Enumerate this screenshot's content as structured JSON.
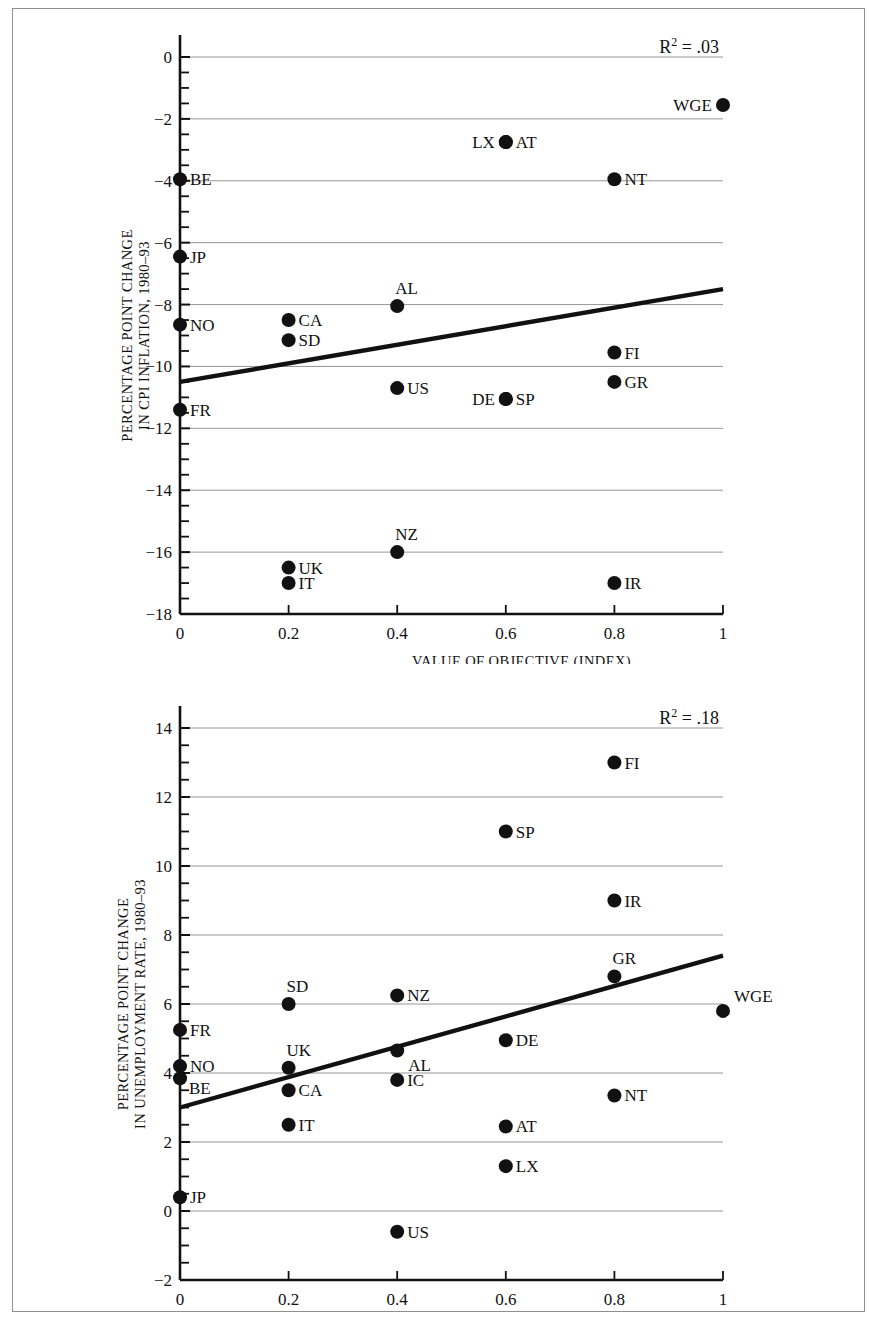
{
  "figure": {
    "background": "#ffffff",
    "frame_color": "#8f8f8f",
    "marker_color": "#111111",
    "gridline_color": "#8a8a8a",
    "axis_color": "#111111",
    "trend_color": "#111111"
  },
  "chart_data": [
    {
      "id": "cpi-inflation",
      "type": "scatter",
      "title": "",
      "xlabel": "VALUE OF OBJECTIVE (INDEX)",
      "ylabel": "PERCENTAGE POINT CHANGE IN CPI INFLATION, 1980–93",
      "ylabel_line1": "PERCENTAGE POINT CHANGE",
      "ylabel_line2": "IN CPI INFLATION, 1980–93",
      "annotation": "R² = .03",
      "annotation_base": "R",
      "annotation_sup": "2",
      "annotation_rest": " = .03",
      "xlim": [
        0,
        1
      ],
      "ylim": [
        -18,
        0
      ],
      "xticks": [
        0,
        0.2,
        0.4,
        0.6,
        0.8,
        1
      ],
      "xticklabels": [
        "0",
        "0.2",
        "0.4",
        "0.6",
        "0.8",
        "1"
      ],
      "yticks": [
        0,
        -2,
        -4,
        -6,
        -8,
        -10,
        -12,
        -14,
        -16,
        -18
      ],
      "yticklabels": [
        "0",
        "−2",
        "−4",
        "−6",
        "−8",
        "−10",
        "−12",
        "−14",
        "−16",
        "−18"
      ],
      "yminor_step": 0.5,
      "grid": true,
      "grid_axis": "y",
      "legend": "none",
      "trendline": {
        "x0": 0,
        "y0": -10.5,
        "x1": 1,
        "y1": -7.5
      },
      "points": [
        {
          "label": "BE",
          "x": 0.0,
          "y": -3.95,
          "lpos": "right"
        },
        {
          "label": "JP",
          "x": 0.0,
          "y": -6.45,
          "lpos": "right"
        },
        {
          "label": "NO",
          "x": 0.0,
          "y": -8.65,
          "lpos": "right"
        },
        {
          "label": "FR",
          "x": 0.0,
          "y": -11.4,
          "lpos": "right"
        },
        {
          "label": "CA",
          "x": 0.2,
          "y": -8.5,
          "lpos": "right"
        },
        {
          "label": "SD",
          "x": 0.2,
          "y": -9.15,
          "lpos": "right"
        },
        {
          "label": "UK",
          "x": 0.2,
          "y": -16.5,
          "lpos": "right"
        },
        {
          "label": "IT",
          "x": 0.2,
          "y": -17.0,
          "lpos": "right"
        },
        {
          "label": "AL",
          "x": 0.4,
          "y": -8.05,
          "lpos": "above"
        },
        {
          "label": "US",
          "x": 0.4,
          "y": -10.7,
          "lpos": "right"
        },
        {
          "label": "NZ",
          "x": 0.4,
          "y": -16.0,
          "lpos": "above"
        },
        {
          "label": "AT",
          "x": 0.6,
          "y": -2.75,
          "lpos": "right"
        },
        {
          "label": "LX",
          "x": 0.6,
          "y": -2.75,
          "lpos": "left"
        },
        {
          "label": "SP",
          "x": 0.6,
          "y": -11.05,
          "lpos": "right"
        },
        {
          "label": "DE",
          "x": 0.6,
          "y": -11.05,
          "lpos": "left"
        },
        {
          "label": "NT",
          "x": 0.8,
          "y": -3.95,
          "lpos": "right"
        },
        {
          "label": "FI",
          "x": 0.8,
          "y": -9.55,
          "lpos": "right"
        },
        {
          "label": "GR",
          "x": 0.8,
          "y": -10.5,
          "lpos": "right"
        },
        {
          "label": "IR",
          "x": 0.8,
          "y": -17.0,
          "lpos": "right"
        },
        {
          "label": "WGE",
          "x": 1.0,
          "y": -1.55,
          "lpos": "left"
        }
      ]
    },
    {
      "id": "unemployment-rate",
      "type": "scatter",
      "title": "",
      "xlabel": "VALUE OF OBJECTIVE (INDEX)",
      "ylabel": "PERCENTAGE POINT CHANGE IN UNEMPLOYMENT RATE, 1980–93",
      "ylabel_line1": "PERCENTAGE POINT CHANGE",
      "ylabel_line2": "IN UNEMPLOYMENT RATE, 1980–93",
      "annotation": "R² = .18",
      "annotation_base": "R",
      "annotation_sup": "2",
      "annotation_rest": " = .18",
      "xlim": [
        0,
        1
      ],
      "ylim": [
        -2,
        14
      ],
      "xticks": [
        0,
        0.2,
        0.4,
        0.6,
        0.8,
        1
      ],
      "xticklabels": [
        "0",
        "0.2",
        "0.4",
        "0.6",
        "0.8",
        "1"
      ],
      "yticks": [
        14,
        12,
        10,
        8,
        6,
        4,
        2,
        0,
        -2
      ],
      "yticklabels": [
        "14",
        "12",
        "10",
        "8",
        "6",
        "4",
        "2",
        "0",
        "−2"
      ],
      "yminor_step": 0.5,
      "grid": true,
      "grid_axis": "y",
      "legend": "none",
      "trendline": {
        "x0": 0,
        "y0": 3.0,
        "x1": 1,
        "y1": 7.4
      },
      "points": [
        {
          "label": "FR",
          "x": 0.0,
          "y": 5.25,
          "lpos": "right"
        },
        {
          "label": "NO",
          "x": 0.0,
          "y": 4.2,
          "lpos": "right"
        },
        {
          "label": "BE",
          "x": 0.0,
          "y": 3.85,
          "lpos": "rightlow"
        },
        {
          "label": "JP",
          "x": 0.0,
          "y": 0.4,
          "lpos": "right"
        },
        {
          "label": "SD",
          "x": 0.2,
          "y": 6.0,
          "lpos": "above"
        },
        {
          "label": "UK",
          "x": 0.2,
          "y": 4.15,
          "lpos": "above"
        },
        {
          "label": "CA",
          "x": 0.2,
          "y": 3.5,
          "lpos": "right"
        },
        {
          "label": "IT",
          "x": 0.2,
          "y": 2.5,
          "lpos": "right"
        },
        {
          "label": "NZ",
          "x": 0.4,
          "y": 6.25,
          "lpos": "right"
        },
        {
          "label": "AL",
          "x": 0.4,
          "y": 4.65,
          "lpos": "belowright"
        },
        {
          "label": "IC",
          "x": 0.4,
          "y": 3.8,
          "lpos": "right"
        },
        {
          "label": "US",
          "x": 0.4,
          "y": -0.6,
          "lpos": "right"
        },
        {
          "label": "SP",
          "x": 0.6,
          "y": 11.0,
          "lpos": "right"
        },
        {
          "label": "DE",
          "x": 0.6,
          "y": 4.95,
          "lpos": "right"
        },
        {
          "label": "AT",
          "x": 0.6,
          "y": 2.45,
          "lpos": "right"
        },
        {
          "label": "LX",
          "x": 0.6,
          "y": 1.3,
          "lpos": "right"
        },
        {
          "label": "FI",
          "x": 0.8,
          "y": 13.0,
          "lpos": "right"
        },
        {
          "label": "IR",
          "x": 0.8,
          "y": 9.0,
          "lpos": "right"
        },
        {
          "label": "GR",
          "x": 0.8,
          "y": 6.8,
          "lpos": "above"
        },
        {
          "label": "NT",
          "x": 0.8,
          "y": 3.35,
          "lpos": "right"
        },
        {
          "label": "WGE",
          "x": 1.0,
          "y": 5.8,
          "lpos": "aboveright"
        }
      ]
    }
  ]
}
